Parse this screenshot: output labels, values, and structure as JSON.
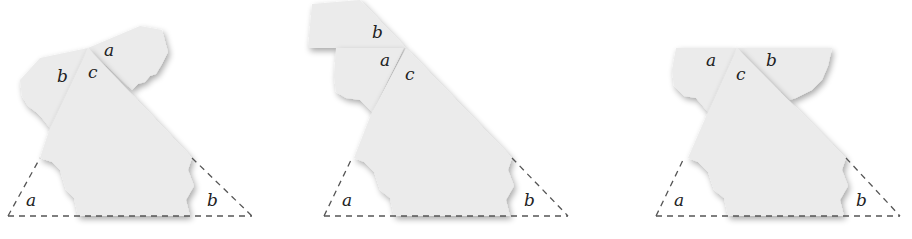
{
  "figure": {
    "panels": [
      {
        "id": "panel-1",
        "labels": {
          "top_left": "b",
          "top_center": "c",
          "top_right": "a",
          "bottom_left": "a",
          "bottom_right": "b"
        }
      },
      {
        "id": "panel-2",
        "labels": {
          "top_upper": "b",
          "top_lower": "a",
          "top_center": "c",
          "bottom_left": "a",
          "bottom_right": "b"
        }
      },
      {
        "id": "panel-3",
        "labels": {
          "top_left": "a",
          "top_center": "c",
          "top_right": "b",
          "bottom_left": "a",
          "bottom_right": "b"
        }
      }
    ],
    "colors": {
      "paper": "#ebebeb",
      "shadow": "#bdbdbd",
      "dash": "#555555",
      "text": "#222222"
    }
  }
}
